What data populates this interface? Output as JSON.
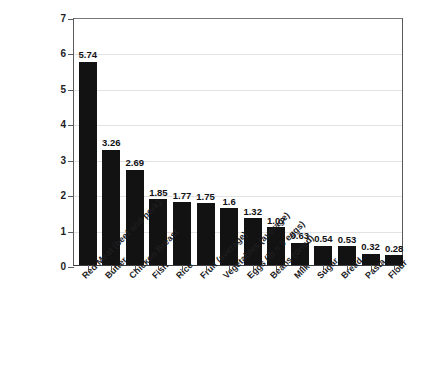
{
  "chart_data": {
    "type": "bar",
    "title": "",
    "xlabel": "",
    "ylabel": "",
    "ylim": [
      0,
      7
    ],
    "ytick_values": [
      0,
      1,
      2,
      3,
      4,
      5,
      6,
      7
    ],
    "ytick_labels": [
      "0",
      "1",
      "2",
      "3",
      "4",
      "5",
      "6",
      "7"
    ],
    "grid": "horizontal",
    "legend": "none",
    "bar_color": "#121212",
    "categories": [
      "Red Meat (beef and pork)",
      "Butter",
      "Chicken Breast",
      "Fish",
      "Rice",
      "Fruit (average)",
      "Vegetables (average)",
      "Eggs (lb = 9 eggs)",
      "Beans (dried)",
      "Milk",
      "Sugar",
      "Bread",
      "Pasta",
      "Flour"
    ],
    "values": [
      5.74,
      3.26,
      2.69,
      1.85,
      1.77,
      1.75,
      1.6,
      1.32,
      1.07,
      0.63,
      0.54,
      0.53,
      0.32,
      0.28
    ],
    "value_labels": [
      "5.74",
      "3.26",
      "2.69",
      "1.85",
      "1.77",
      "1.75",
      "1.6",
      "1.32",
      "1.07",
      "0.63",
      "0.54",
      "0.53",
      "0.32",
      "0.28"
    ]
  },
  "colors": {
    "background": "#ffffff",
    "bar": "#121212",
    "gridline": "#e3e3e6",
    "axis": "#5a5a5e",
    "text": "#1d1d1f"
  }
}
